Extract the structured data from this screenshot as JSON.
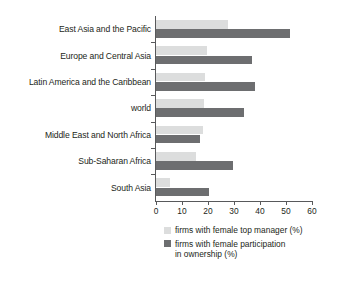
{
  "chart_data": {
    "type": "bar",
    "orientation": "horizontal",
    "title": "",
    "subtitle": "",
    "xlabel": "",
    "ylabel": "",
    "xlim": [
      0,
      60
    ],
    "xticks": [
      0,
      10,
      20,
      30,
      40,
      50,
      60
    ],
    "xtick_labels": [
      "0",
      "10",
      "20",
      "30",
      "40",
      "50",
      "60"
    ],
    "grid": false,
    "legend_position": "bottom",
    "categories": [
      "East Asia and the Pacific",
      "Europe and Central Asia",
      "Latin America and the Caribbean",
      "world",
      "Middle East and North Africa",
      "Sub-Saharan Africa",
      "South Asia"
    ],
    "series": [
      {
        "name": "firms with female top manager (%)",
        "color": "#dcdddd",
        "values": [
          27.5,
          19.5,
          19.0,
          18.5,
          18.0,
          15.5,
          5.5
        ]
      },
      {
        "name": "firms with female participation in ownership (%)",
        "color": "#6d6e70",
        "values": [
          51.5,
          37.0,
          38.0,
          34.0,
          17.0,
          29.5,
          20.5
        ]
      }
    ],
    "legend_entries": [
      "firms with female top manager (%)",
      "firms with female participation\nin ownership (%)"
    ]
  },
  "colors": {
    "light_bar": "#dcdddd",
    "dark_bar": "#6d6e70",
    "axis": "#58595b",
    "text": "#231f20",
    "background": "#ffffff"
  }
}
